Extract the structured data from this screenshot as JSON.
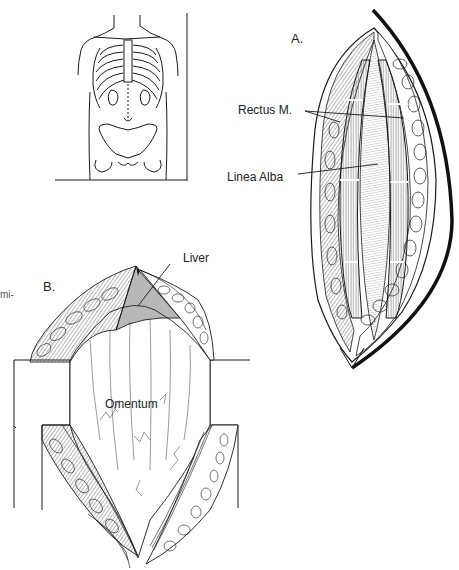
{
  "figure": {
    "margin_fragment": "mi-",
    "inset": {
      "name": "torso-incision-site",
      "description": "Front view of torso with ribcage, xiphoid, umbilicus and pelvis; dashed midline incision line"
    },
    "panel_a": {
      "letter": "A.",
      "labels": {
        "rectus": "Rectus M.",
        "linea_alba": "Linea Alba"
      }
    },
    "panel_b": {
      "letter": "B.",
      "labels": {
        "liver": "Liver",
        "omentum": "Omentum"
      }
    },
    "colors": {
      "ink": "#1a1a1a",
      "paper": "#ffffff",
      "hatch": "#555555"
    }
  }
}
